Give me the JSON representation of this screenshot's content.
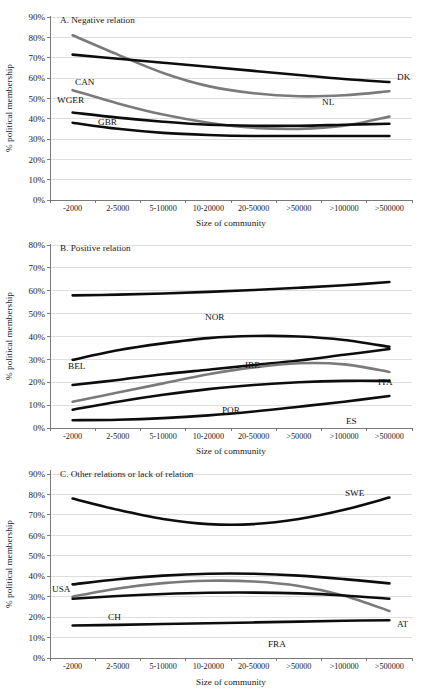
{
  "page": {
    "cut_off_header": "",
    "background": "#ffffff"
  },
  "axes": {
    "x_title": "Size of community",
    "y_title": "% political membership",
    "x_categories": [
      "-2000",
      "2-5000",
      "5-10000",
      "10-20000",
      "20-50000",
      ">50000",
      ">100000",
      ">500000"
    ],
    "y_ticks_ac": [
      "0%",
      "10%",
      "20%",
      "30%",
      "40%",
      "50%",
      "60%",
      "70%",
      "80%",
      "90%"
    ],
    "y_ticks_b": [
      "0%",
      "10%",
      "20%",
      "30%",
      "40%",
      "50%",
      "60%",
      "70%",
      "80%"
    ]
  },
  "colors": {
    "black_series": "#0d0d0d",
    "gray_series": "#7a7a7a",
    "gridline": "#c8c8c8",
    "axis": "#6e6e6e",
    "text": "#1a1a1a"
  },
  "panels": {
    "a": {
      "title": "A. Negative relation"
    },
    "b": {
      "title": "B. Positive relation"
    },
    "c": {
      "title": "C. Other relations or lack of relation"
    }
  },
  "labels": {
    "a": {
      "nl": "NL",
      "dk": "DK",
      "can": "CAN",
      "wger": "WGER",
      "gbr": "GBR"
    },
    "b": {
      "nor": "NOR",
      "bel": "BEL",
      "ire": "IRE",
      "ita": "ITA",
      "por": "POR",
      "es": "ES"
    },
    "c": {
      "swe": "SWE",
      "usa": "USA",
      "ch": "CH",
      "at": "AT",
      "fra": "FRA"
    }
  },
  "chart_data": [
    {
      "type": "line",
      "title": "A. Negative relation",
      "xlabel": "Size of community",
      "ylabel": "% political membership",
      "ylim": [
        0,
        90
      ],
      "grid": true,
      "legend": "inline-labels",
      "categories": [
        "-2000",
        "2-5000",
        "5-10000",
        "10-20000",
        "20-50000",
        ">50000",
        ">100000",
        ">500000"
      ],
      "series": [
        {
          "name": "NL",
          "color": "#7a7a7a",
          "values": [
            81.0,
            71.5,
            62.5,
            56.0,
            52.5,
            51.0,
            51.5,
            53.5
          ]
        },
        {
          "name": "DK",
          "color": "#0d0d0d",
          "values": [
            71.5,
            69.5,
            67.5,
            65.5,
            63.5,
            61.5,
            59.5,
            58.0
          ]
        },
        {
          "name": "CAN",
          "color": "#7a7a7a",
          "values": [
            54.0,
            47.5,
            42.0,
            38.0,
            35.5,
            35.0,
            36.5,
            41.0
          ]
        },
        {
          "name": "WGER",
          "color": "#0d0d0d",
          "values": [
            43.0,
            40.5,
            38.5,
            37.0,
            36.5,
            36.5,
            37.0,
            37.5
          ]
        },
        {
          "name": "GBR",
          "color": "#0d0d0d",
          "values": [
            38.0,
            35.0,
            33.0,
            32.0,
            31.5,
            31.5,
            31.5,
            31.5
          ]
        }
      ]
    },
    {
      "type": "line",
      "title": "B. Positive relation",
      "xlabel": "Size of community",
      "ylabel": "% political membership",
      "ylim": [
        0,
        80
      ],
      "grid": true,
      "legend": "inline-labels",
      "categories": [
        "-2000",
        "2-5000",
        "5-10000",
        "10-20000",
        "20-50000",
        ">50000",
        ">100000",
        ">500000"
      ],
      "series": [
        {
          "name": "NOR",
          "color": "#0d0d0d",
          "values": [
            58.0,
            58.3,
            58.8,
            59.5,
            60.3,
            61.3,
            62.4,
            63.8
          ]
        },
        {
          "name": "BEL",
          "color": "#0d0d0d",
          "values": [
            29.8,
            34.0,
            37.0,
            39.3,
            40.2,
            40.0,
            38.5,
            35.5
          ]
        },
        {
          "name": "IRE",
          "color": "#0d0d0d",
          "values": [
            18.8,
            21.0,
            23.5,
            25.5,
            27.5,
            29.5,
            32.0,
            34.5
          ]
        },
        {
          "name": "ITA",
          "color": "#7a7a7a",
          "values": [
            11.5,
            15.5,
            19.5,
            23.5,
            26.5,
            28.3,
            27.8,
            24.5
          ]
        },
        {
          "name": "POR",
          "color": "#0d0d0d",
          "values": [
            8.0,
            11.5,
            14.5,
            17.0,
            18.8,
            20.0,
            20.6,
            20.6
          ]
        },
        {
          "name": "ES",
          "color": "#0d0d0d",
          "values": [
            3.4,
            3.6,
            4.3,
            5.5,
            7.2,
            9.3,
            11.5,
            14.0
          ]
        }
      ]
    },
    {
      "type": "line",
      "title": "C. Other relations or lack of relation",
      "xlabel": "Size of community",
      "ylabel": "% political membership",
      "ylim": [
        0,
        90
      ],
      "grid": true,
      "legend": "inline-labels",
      "categories": [
        "-2000",
        "2-5000",
        "5-10000",
        "10-20000",
        "20-50000",
        ">50000",
        ">100000",
        ">500000"
      ],
      "series": [
        {
          "name": "SWE",
          "color": "#0d0d0d",
          "values": [
            78.0,
            72.5,
            68.0,
            65.5,
            65.5,
            68.0,
            72.5,
            78.5
          ]
        },
        {
          "name": "USA",
          "color": "#0d0d0d",
          "values": [
            36.0,
            38.5,
            40.3,
            41.2,
            41.2,
            40.3,
            38.6,
            36.5
          ]
        },
        {
          "name": "AT",
          "color": "#7a7a7a",
          "values": [
            30.0,
            34.0,
            36.6,
            37.8,
            37.4,
            35.2,
            30.5,
            23.0
          ]
        },
        {
          "name": "CH",
          "color": "#0d0d0d",
          "values": [
            29.0,
            30.3,
            31.3,
            31.9,
            32.0,
            31.6,
            30.6,
            29.0
          ]
        },
        {
          "name": "FRA",
          "color": "#0d0d0d",
          "values": [
            15.9,
            16.2,
            16.6,
            17.0,
            17.4,
            17.8,
            18.2,
            18.5
          ]
        }
      ]
    }
  ],
  "inline_label_positions": {
    "a": [
      {
        "name": "CAN",
        "x": 75,
        "y": 77
      },
      {
        "name": "WGER",
        "x": 57,
        "y": 95
      },
      {
        "name": "GBR",
        "x": 98,
        "y": 117
      },
      {
        "name": "NL",
        "x": 322,
        "y": 97
      },
      {
        "name": "DK",
        "x": 397,
        "y": 72
      }
    ],
    "b": [
      {
        "name": "NOR",
        "x": 205,
        "y": 84
      },
      {
        "name": "BEL",
        "x": 68,
        "y": 133
      },
      {
        "name": "IRE",
        "x": 245,
        "y": 132
      },
      {
        "name": "ITA",
        "x": 378,
        "y": 149
      },
      {
        "name": "POR",
        "x": 222,
        "y": 177
      },
      {
        "name": "ES",
        "x": 346,
        "y": 188
      }
    ],
    "c": [
      {
        "name": "SWE",
        "x": 345,
        "y": 34
      },
      {
        "name": "USA",
        "x": 52,
        "y": 130
      },
      {
        "name": "CH",
        "x": 108,
        "y": 158
      },
      {
        "name": "AT",
        "x": 397,
        "y": 165
      },
      {
        "name": "FRA",
        "x": 268,
        "y": 185
      }
    ]
  }
}
